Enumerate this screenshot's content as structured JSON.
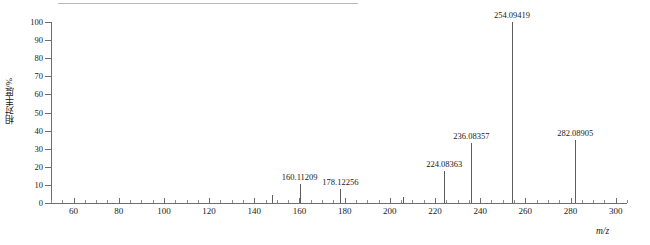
{
  "chart_data": {
    "type": "bar",
    "subtype": "mass-spectrum",
    "title": "",
    "xlabel": "m/z",
    "ylabel": "相对丰度/%",
    "xlim": [
      50,
      305
    ],
    "ylim": [
      0,
      100
    ],
    "grid": false,
    "legend": null,
    "x_ticks_major": [
      60,
      80,
      100,
      120,
      140,
      160,
      180,
      200,
      220,
      240,
      260,
      280,
      300
    ],
    "x_tick_labels": [
      "60",
      "80",
      "100",
      "120",
      "140",
      "160",
      "180",
      "200",
      "220",
      "240",
      "260",
      "280",
      "300"
    ],
    "x_tick_minor_step": 5,
    "y_ticks": [
      0,
      10,
      20,
      30,
      40,
      50,
      60,
      70,
      80,
      90,
      100
    ],
    "y_tick_labels": [
      "0",
      "10",
      "20",
      "30",
      "40",
      "50",
      "60",
      "70",
      "80",
      "90",
      "100"
    ],
    "peaks": [
      {
        "mz": 148.0,
        "intensity": 4.5,
        "label": ""
      },
      {
        "mz": 160.11209,
        "intensity": 10.5,
        "label": "160.11209"
      },
      {
        "mz": 178.12256,
        "intensity": 8.0,
        "label": "178.12256"
      },
      {
        "mz": 206.0,
        "intensity": 3.5,
        "label": ""
      },
      {
        "mz": 224.08363,
        "intensity": 17.5,
        "label": "224.08363"
      },
      {
        "mz": 236.08357,
        "intensity": 33.0,
        "label": "236.08357"
      },
      {
        "mz": 254.09419,
        "intensity": 100.0,
        "label": "254.09419"
      },
      {
        "mz": 282.08905,
        "intensity": 35.0,
        "label": "282.08905"
      }
    ],
    "base_peak": "254.09419",
    "colors": {
      "peak": "#5d5d5d",
      "axis": "#6f6f6f",
      "text": "#1a1a1a",
      "rule": "#b9b9b9",
      "background": "#ffffff"
    }
  }
}
